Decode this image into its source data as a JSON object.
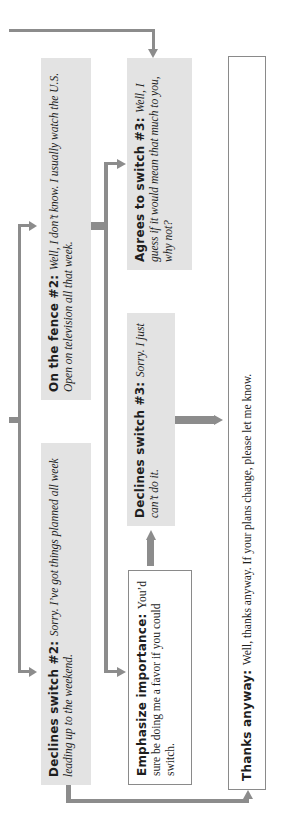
{
  "diagram": {
    "orientation": "rotated-90-ccw",
    "colors": {
      "box_fill": "#e3e3e3",
      "arrow": "#8c8c8c",
      "outline": "#8a8a8a",
      "text": "#1e1e1e"
    },
    "nodes": {
      "on_the_fence_2": {
        "label": "On the fence #2:",
        "text": "Well, I don’t know. I usually watch the U.S. Open on television all that week."
      },
      "agrees_switch_3": {
        "label": "Agrees to switch #3:",
        "text": "Well, I guess if it would mean that much to you, why not?"
      },
      "declines_switch_3": {
        "label": "Declines switch #3:",
        "text": "Sorry. I just can’t do it."
      },
      "declines_switch_2": {
        "label": "Declines switch #2:",
        "text": "Sorry. I’ve got things planned all week leading up to the weekend."
      },
      "emphasize_importance": {
        "label": "Emphasize importance:",
        "text": "You’d sure be doing me a favor if you could switch."
      },
      "thanks_anyway": {
        "label": "Thanks anyway:",
        "text": "Well, thanks anyway. If your plans change, please let me know."
      }
    },
    "edges": [
      {
        "from": "upstream",
        "to": "agrees_switch_3"
      },
      {
        "from": "upstream",
        "to": "on_the_fence_2"
      },
      {
        "from": "upstream",
        "to": "declines_switch_2"
      },
      {
        "from": "on_the_fence_2",
        "to": "agrees_switch_3"
      },
      {
        "from": "on_the_fence_2",
        "to": "emphasize_importance"
      },
      {
        "from": "emphasize_importance",
        "to": "declines_switch_3"
      },
      {
        "from": "declines_switch_3",
        "to": "thanks_anyway"
      },
      {
        "from": "declines_switch_2",
        "to": "thanks_anyway"
      }
    ]
  }
}
